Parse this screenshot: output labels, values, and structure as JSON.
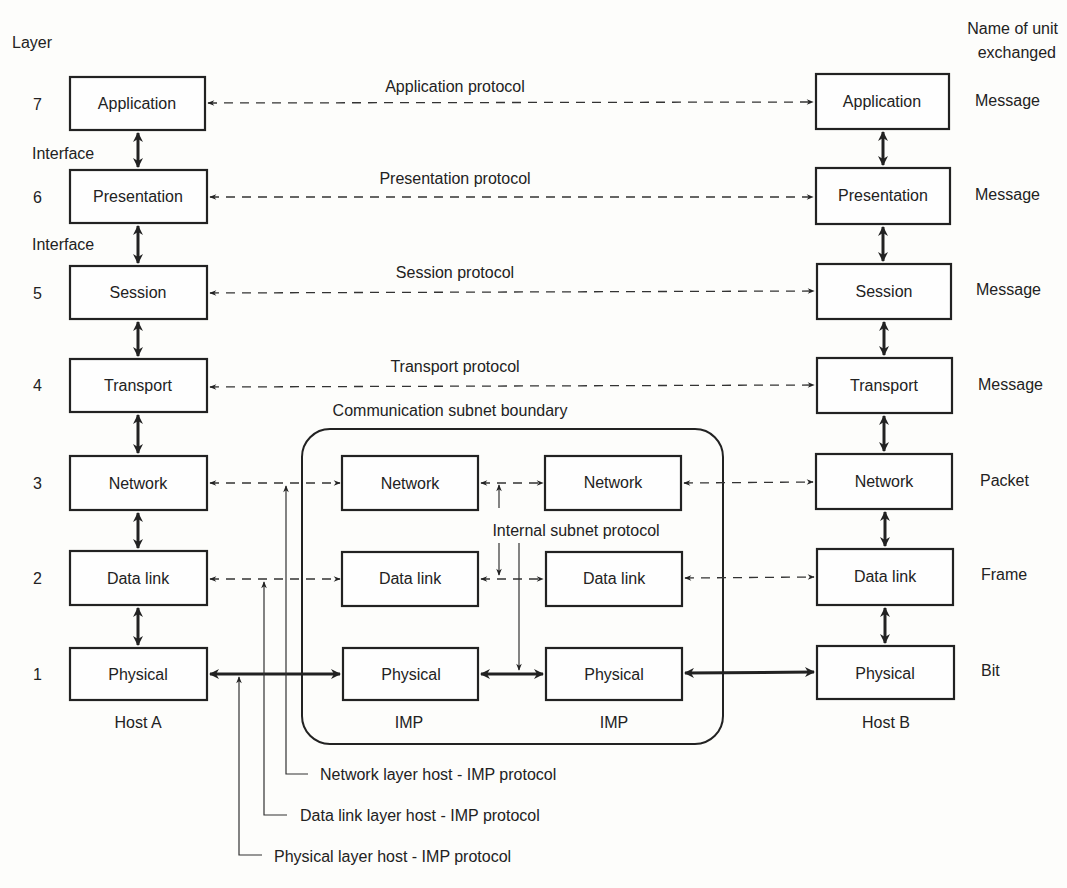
{
  "header": {
    "layer_label": "Layer",
    "unit_label_line1": "Name of unit",
    "unit_label_line2": "exchanged"
  },
  "layers": [
    {
      "number": "7",
      "name": "Application",
      "unit": "Message",
      "protocol": "Application protocol"
    },
    {
      "number": "6",
      "name": "Presentation",
      "unit": "Message",
      "protocol": "Presentation protocol"
    },
    {
      "number": "5",
      "name": "Session",
      "unit": "Message",
      "protocol": "Session protocol"
    },
    {
      "number": "4",
      "name": "Transport",
      "unit": "Message",
      "protocol": "Transport protocol"
    },
    {
      "number": "3",
      "name": "Network",
      "unit": "Packet"
    },
    {
      "number": "2",
      "name": "Data link",
      "unit": "Frame"
    },
    {
      "number": "1",
      "name": "Physical",
      "unit": "Bit"
    }
  ],
  "interface_label": "Interface",
  "hosts": {
    "left": "Host A",
    "right": "Host B"
  },
  "subnet": {
    "title": "Communication subnet boundary",
    "internal_protocol": "Internal subnet protocol",
    "imp_label": "IMP",
    "imp_layers": [
      "Network",
      "Data link",
      "Physical"
    ]
  },
  "host_imp_protocols": [
    "Network layer host - IMP protocol",
    "Data link layer host - IMP protocol",
    "Physical layer host - IMP protocol"
  ]
}
